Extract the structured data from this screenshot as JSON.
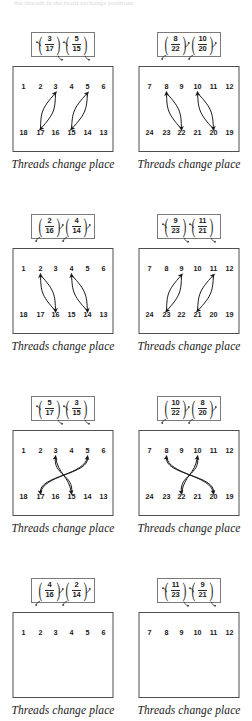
{
  "document": {
    "top_cut_text": "the threads in the braid exchange positions",
    "caption": "Threads change place"
  },
  "blocks": [
    {
      "id": "block-1-left",
      "row": 1,
      "column": "left",
      "cycles": [
        {
          "num": "3",
          "den": "17",
          "arrows": [
            "tl",
            "br"
          ]
        },
        {
          "num": "5",
          "den": "15",
          "arrows": [
            "tl",
            "br"
          ]
        }
      ],
      "diagram": {
        "top_row": [
          "1",
          "2",
          "3",
          "4",
          "5",
          "6"
        ],
        "bottom_row": [
          "18",
          "17",
          "16",
          "15",
          "14",
          "13"
        ],
        "swaps": [
          {
            "top_index": 2,
            "bottom_index": 1,
            "crossing": false
          },
          {
            "top_index": 4,
            "bottom_index": 3,
            "crossing": false
          }
        ]
      }
    },
    {
      "id": "block-1-right",
      "row": 1,
      "column": "right",
      "cycles": [
        {
          "num": "8",
          "den": "22",
          "arrows": [
            "tr",
            "bl"
          ]
        },
        {
          "num": "10",
          "den": "20",
          "arrows": [
            "tr",
            "bl"
          ]
        }
      ],
      "diagram": {
        "top_row": [
          "7",
          "8",
          "9",
          "10",
          "11",
          "12"
        ],
        "bottom_row": [
          "24",
          "23",
          "22",
          "21",
          "20",
          "19"
        ],
        "swaps": [
          {
            "top_index": 1,
            "bottom_index": 2,
            "crossing": false
          },
          {
            "top_index": 3,
            "bottom_index": 4,
            "crossing": false
          }
        ]
      }
    },
    {
      "id": "block-2-left",
      "row": 2,
      "column": "left",
      "cycles": [
        {
          "num": "2",
          "den": "16",
          "arrows": [
            "tr",
            "bl"
          ]
        },
        {
          "num": "4",
          "den": "14",
          "arrows": [
            "tr",
            "bl"
          ]
        }
      ],
      "diagram": {
        "top_row": [
          "1",
          "2",
          "3",
          "4",
          "5",
          "6"
        ],
        "bottom_row": [
          "18",
          "17",
          "16",
          "15",
          "14",
          "13"
        ],
        "swaps": [
          {
            "top_index": 1,
            "bottom_index": 2,
            "crossing": false
          },
          {
            "top_index": 3,
            "bottom_index": 4,
            "crossing": false
          }
        ]
      }
    },
    {
      "id": "block-2-right",
      "row": 2,
      "column": "right",
      "cycles": [
        {
          "num": "9",
          "den": "23",
          "arrows": [
            "tl",
            "br"
          ]
        },
        {
          "num": "11",
          "den": "21",
          "arrows": [
            "tl",
            "br"
          ]
        }
      ],
      "diagram": {
        "top_row": [
          "7",
          "8",
          "9",
          "10",
          "11",
          "12"
        ],
        "bottom_row": [
          "24",
          "23",
          "22",
          "21",
          "20",
          "19"
        ],
        "swaps": [
          {
            "top_index": 2,
            "bottom_index": 1,
            "crossing": false
          },
          {
            "top_index": 4,
            "bottom_index": 3,
            "crossing": false
          }
        ]
      }
    },
    {
      "id": "block-3-left",
      "row": 3,
      "column": "left",
      "cycles": [
        {
          "num": "5",
          "den": "17",
          "arrows": [
            "tl",
            "br"
          ]
        },
        {
          "num": "3",
          "den": "15",
          "arrows": [
            "tl",
            "br"
          ]
        }
      ],
      "diagram": {
        "top_row": [
          "1",
          "2",
          "3",
          "4",
          "5",
          "6"
        ],
        "bottom_row": [
          "18",
          "17",
          "16",
          "15",
          "14",
          "13"
        ],
        "swaps": [
          {
            "top_index": 2,
            "bottom_index": 3,
            "crossing": true
          },
          {
            "top_index": 4,
            "bottom_index": 1,
            "crossing": true
          }
        ]
      }
    },
    {
      "id": "block-3-right",
      "row": 3,
      "column": "right",
      "cycles": [
        {
          "num": "10",
          "den": "22",
          "arrows": [
            "tr",
            "bl"
          ]
        },
        {
          "num": "8",
          "den": "20",
          "arrows": [
            "tr",
            "bl"
          ]
        }
      ],
      "diagram": {
        "top_row": [
          "7",
          "8",
          "9",
          "10",
          "11",
          "12"
        ],
        "bottom_row": [
          "24",
          "23",
          "22",
          "21",
          "20",
          "19"
        ],
        "swaps": [
          {
            "top_index": 3,
            "bottom_index": 2,
            "crossing": true
          },
          {
            "top_index": 1,
            "bottom_index": 4,
            "crossing": true
          }
        ]
      }
    },
    {
      "id": "block-4-left",
      "row": 4,
      "column": "left",
      "cycles": [
        {
          "num": "4",
          "den": "16",
          "arrows": [
            "tr",
            "bl"
          ]
        },
        {
          "num": "2",
          "den": "14",
          "arrows": [
            "tr",
            "bl"
          ]
        }
      ],
      "diagram": {
        "top_row": [
          "1",
          "2",
          "3",
          "4",
          "5",
          "6"
        ],
        "bottom_row": [],
        "swaps": []
      }
    },
    {
      "id": "block-4-right",
      "row": 4,
      "column": "right",
      "cycles": [
        {
          "num": "11",
          "den": "23",
          "arrows": [
            "tl",
            "br"
          ]
        },
        {
          "num": "9",
          "den": "21",
          "arrows": [
            "tl",
            "br"
          ]
        }
      ],
      "diagram": {
        "top_row": [
          "7",
          "8",
          "9",
          "10",
          "11",
          "12"
        ],
        "bottom_row": [],
        "swaps": []
      }
    }
  ],
  "colors": {
    "ink": "#1a1a1a",
    "box_border": "#4f4f4f",
    "cycle_border": "#7a7a7a",
    "background": "#ffffff"
  }
}
